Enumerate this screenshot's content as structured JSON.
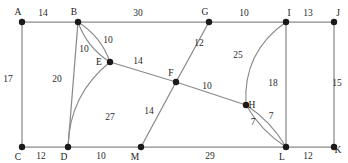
{
  "figure": {
    "width": 348,
    "height": 163,
    "background_color": "#ffffff",
    "edge_color": "#8a8a8a",
    "node_color": "#1a1a1a",
    "label_color": "#1a1a1a"
  },
  "chart_data": {
    "type": "diagram",
    "subtype": "weighted-undirected-multigraph",
    "title": "",
    "xlabel": "",
    "ylabel": "",
    "grid": false,
    "legend": "none",
    "node_count": 13,
    "edge_count": 21,
    "nodes": [
      {
        "id": "A",
        "label": "A",
        "x": 22,
        "y": 22,
        "label_x": 18,
        "label_y": 15
      },
      {
        "id": "B",
        "label": "B",
        "x": 78,
        "y": 22,
        "label_x": 74,
        "label_y": 15
      },
      {
        "id": "G",
        "label": "G",
        "x": 209,
        "y": 22,
        "label_x": 205,
        "label_y": 15
      },
      {
        "id": "I",
        "label": "I",
        "x": 286,
        "y": 22,
        "label_x": 289,
        "label_y": 16
      },
      {
        "id": "J",
        "label": "J",
        "x": 334,
        "y": 22,
        "label_x": 338,
        "label_y": 16
      },
      {
        "id": "E",
        "label": "E",
        "x": 110,
        "y": 62,
        "label_x": 99,
        "label_y": 65
      },
      {
        "id": "F",
        "label": "F",
        "x": 176,
        "y": 82,
        "label_x": 171,
        "label_y": 76
      },
      {
        "id": "H",
        "label": "H",
        "x": 246,
        "y": 105,
        "label_x": 252,
        "label_y": 108
      },
      {
        "id": "C",
        "label": "C",
        "x": 22,
        "y": 147,
        "label_x": 18,
        "label_y": 160
      },
      {
        "id": "D",
        "label": "D",
        "x": 68,
        "y": 147,
        "label_x": 64,
        "label_y": 160
      },
      {
        "id": "M",
        "label": "M",
        "x": 141,
        "y": 147,
        "label_x": 135,
        "label_y": 160
      },
      {
        "id": "L",
        "label": "L",
        "x": 286,
        "y": 147,
        "label_x": 282,
        "label_y": 160
      },
      {
        "id": "K",
        "label": "K",
        "x": 334,
        "y": 147,
        "label_x": 338,
        "label_y": 153
      }
    ],
    "edges": [
      {
        "from": "A",
        "to": "B",
        "weight": 14,
        "shape": "line",
        "label_x": 43,
        "label_y": 16
      },
      {
        "from": "B",
        "to": "G",
        "weight": 30,
        "shape": "line",
        "label_x": 138,
        "label_y": 16
      },
      {
        "from": "G",
        "to": "I",
        "weight": 10,
        "shape": "line",
        "label_x": 244,
        "label_y": 16
      },
      {
        "from": "I",
        "to": "J",
        "weight": 13,
        "shape": "line",
        "label_x": 308,
        "label_y": 16
      },
      {
        "from": "A",
        "to": "C",
        "weight": 17,
        "shape": "line",
        "label_x": 8,
        "label_y": 82
      },
      {
        "from": "B",
        "to": "D",
        "weight": 20,
        "shape": "line",
        "label_x": 57,
        "label_y": 82
      },
      {
        "from": "I",
        "to": "L",
        "weight": 18,
        "shape": "line",
        "label_x": 273,
        "label_y": 86
      },
      {
        "from": "J",
        "to": "K",
        "weight": 15,
        "shape": "line",
        "label_x": 337,
        "label_y": 86
      },
      {
        "from": "C",
        "to": "D",
        "weight": 12,
        "shape": "line",
        "label_x": 41,
        "label_y": 159
      },
      {
        "from": "D",
        "to": "M",
        "weight": 10,
        "shape": "line",
        "label_x": 101,
        "label_y": 159
      },
      {
        "from": "M",
        "to": "L",
        "weight": 29,
        "shape": "line",
        "label_x": 210,
        "label_y": 159
      },
      {
        "from": "L",
        "to": "K",
        "weight": 12,
        "shape": "line",
        "label_x": 308,
        "label_y": 159
      },
      {
        "from": "B",
        "to": "E",
        "weight": 10,
        "shape": "curve",
        "curvature": -9,
        "label_x": 84,
        "label_y": 52
      },
      {
        "from": "B",
        "to": "E",
        "weight": 10,
        "shape": "curve",
        "curvature": 9,
        "label_x": 108,
        "label_y": 43
      },
      {
        "from": "E",
        "to": "F",
        "weight": 14,
        "shape": "line",
        "label_x": 138,
        "label_y": 64
      },
      {
        "from": "G",
        "to": "F",
        "weight": 12,
        "shape": "line",
        "label_x": 199,
        "label_y": 46
      },
      {
        "from": "F",
        "to": "H",
        "weight": 10,
        "shape": "line",
        "label_x": 207,
        "label_y": 89
      },
      {
        "from": "F",
        "to": "M",
        "weight": 14,
        "shape": "line",
        "label_x": 149,
        "label_y": 114
      },
      {
        "from": "E",
        "to": "D",
        "weight": 27,
        "shape": "curve",
        "curvature": 22,
        "label_x": 110,
        "label_y": 120
      },
      {
        "from": "I",
        "to": "H",
        "weight": 25,
        "shape": "curve",
        "curvature": 26,
        "label_x": 238,
        "label_y": 58
      },
      {
        "from": "H",
        "to": "L",
        "weight": 7,
        "shape": "curve",
        "curvature": 7,
        "label_x": 253,
        "label_y": 125
      },
      {
        "from": "H",
        "to": "L",
        "weight": 7,
        "shape": "curve",
        "curvature": -7,
        "label_x": 271,
        "label_y": 119
      }
    ]
  }
}
